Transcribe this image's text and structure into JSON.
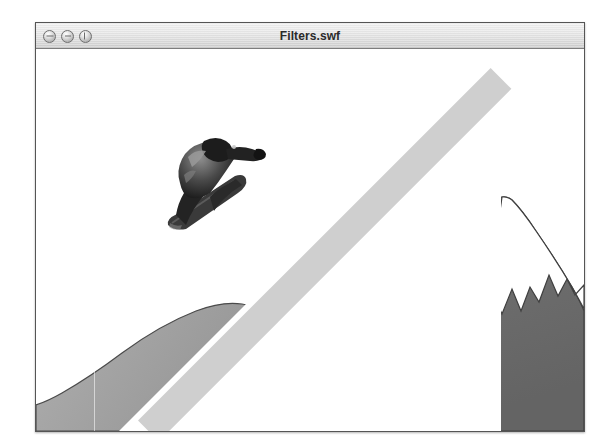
{
  "window": {
    "title": "Filters.swf",
    "controls": [
      {
        "name": "close-button",
        "label": "Close",
        "icon": "close-icon"
      },
      {
        "name": "minimize-button",
        "label": "Minimize",
        "icon": "minimize-icon"
      },
      {
        "name": "zoom-button",
        "label": "Zoom",
        "icon": "zoom-icon"
      }
    ],
    "resize_grip_label": "Resize"
  },
  "stage": {
    "background_color": "#ffffff",
    "description": "Grayscale snowboarding scene: a snowboarder in mid-air over a rolling foreground hill with a snow-capped mountain at right.",
    "objects": [
      {
        "name": "snowboarder",
        "label": "Snowboarder",
        "kind": "bitmap-silhouette",
        "color": "#2b2b2b"
      },
      {
        "name": "foreground-hill",
        "label": "Foreground hill",
        "kind": "vector-shape",
        "gradient_from": "#a9a9a9",
        "gradient_to": "#8e8e8e",
        "outline_color": "#4a4a4a"
      },
      {
        "name": "mountain",
        "label": "Mountain",
        "kind": "vector-shape",
        "color": "#6e6e6e",
        "outline_color": "#3f3f3f"
      },
      {
        "name": "snow-cap",
        "label": "Snow cap",
        "kind": "vector-shape",
        "color": "#ffffff",
        "outline_color": "#3f3f3f"
      }
    ]
  }
}
